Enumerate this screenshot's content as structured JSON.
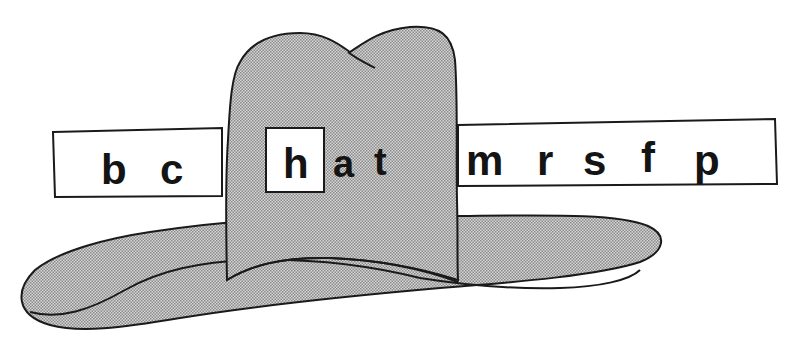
{
  "illustration": {
    "subject": "hat",
    "window_letter": "h",
    "word_ending": [
      "a",
      "t"
    ],
    "word": "hat",
    "strip_letters_left": [
      "b",
      "c"
    ],
    "strip_letters_right": [
      "m",
      "r",
      "s",
      "f",
      "p"
    ]
  },
  "colors": {
    "background": "#ffffff",
    "outline": "#1a1a1a",
    "hat_fill": "#b9b9b9",
    "strip_fill": "#ffffff",
    "text": "#141414"
  }
}
